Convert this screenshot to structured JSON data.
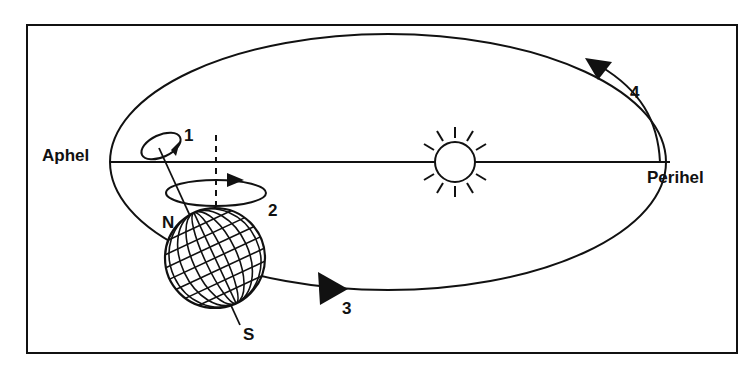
{
  "diagram": {
    "labels": {
      "aphel": "Aphel",
      "perihel": "Perihel",
      "north": "N",
      "south": "S",
      "m1": "1",
      "m2": "2",
      "m3": "3",
      "m4": "4"
    },
    "colors": {
      "stroke": "#111111",
      "background": "#ffffff"
    }
  }
}
